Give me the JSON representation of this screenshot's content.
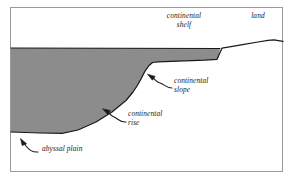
{
  "figure": {
    "colors": {
      "water_fill": "#8c8c8c",
      "land_fill": "#ffffff",
      "outline": "#1a1a1a",
      "frame": "#9a9a9a",
      "background": "#ffffff",
      "text": "#1a1a1a"
    },
    "frame": {
      "x": 10,
      "y": 7,
      "width": 273,
      "height": 165
    }
  },
  "labels": {
    "continental_shelf": "continental\nshelf",
    "land": "land",
    "continental_slope": "continental\nslope",
    "continental_rise": "continental\nrise",
    "abyssal_plain": "abyssal plain"
  },
  "diagram_data": {
    "type": "cross-section",
    "sea_level_y": 48,
    "water_surface": {
      "from_x": 11,
      "to_x": 222,
      "y": 48
    },
    "seafloor_profile": [
      {
        "x": 11,
        "y": 132,
        "feature": "abyssal plain"
      },
      {
        "x": 40,
        "y": 133,
        "feature": "abyssal plain"
      },
      {
        "x": 62,
        "y": 133,
        "feature": "abyssal plain"
      },
      {
        "x": 78,
        "y": 130,
        "feature": "continental rise"
      },
      {
        "x": 96,
        "y": 122,
        "feature": "continental rise"
      },
      {
        "x": 112,
        "y": 112,
        "feature": "continental rise"
      },
      {
        "x": 126,
        "y": 100,
        "feature": "continental rise"
      },
      {
        "x": 136,
        "y": 88,
        "feature": "continental slope"
      },
      {
        "x": 144,
        "y": 74,
        "feature": "continental slope"
      },
      {
        "x": 149,
        "y": 66,
        "feature": "continental slope"
      },
      {
        "x": 154,
        "y": 62,
        "feature": "shelf break"
      },
      {
        "x": 178,
        "y": 61,
        "feature": "continental shelf"
      },
      {
        "x": 205,
        "y": 60,
        "feature": "continental shelf"
      },
      {
        "x": 218,
        "y": 59,
        "feature": "continental shelf"
      },
      {
        "x": 222,
        "y": 48,
        "feature": "shoreline"
      },
      {
        "x": 238,
        "y": 45,
        "feature": "land"
      },
      {
        "x": 258,
        "y": 42,
        "feature": "land"
      },
      {
        "x": 272,
        "y": 40,
        "feature": "land"
      },
      {
        "x": 283,
        "y": 41,
        "feature": "land"
      }
    ],
    "annotations": [
      {
        "name": "continental-slope",
        "target_x": 148,
        "target_y": 75,
        "label_x": 174,
        "label_y": 80
      },
      {
        "name": "continental-rise",
        "target_x": 104,
        "target_y": 110,
        "label_x": 128,
        "label_y": 113
      },
      {
        "name": "abyssal-plain",
        "target_x": 22,
        "target_y": 143,
        "label_x": 42,
        "label_y": 148
      }
    ]
  }
}
